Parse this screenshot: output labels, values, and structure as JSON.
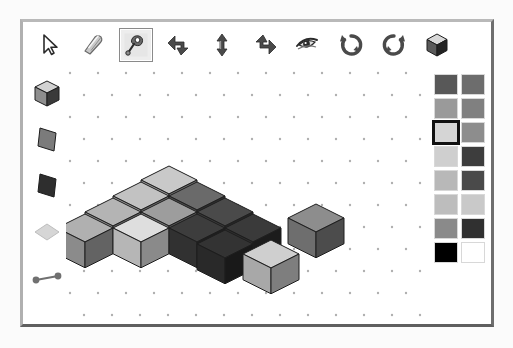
{
  "app": {
    "title": "Isometric Cube Builder",
    "background_color": "#ffffff",
    "frame_color": "#8a8a8a"
  },
  "toolbar": {
    "name": "main-toolbar",
    "selected_index": 2,
    "tools": [
      {
        "id": "select-arrow",
        "label": "Select",
        "icon": "cursor-arrow-icon",
        "selected": false,
        "x": 10
      },
      {
        "id": "eraser",
        "label": "Eraser",
        "icon": "eraser-icon",
        "selected": false,
        "x": 53
      },
      {
        "id": "paint-spray",
        "label": "Paint",
        "icon": "paint-spray-icon",
        "selected": true,
        "x": 96
      },
      {
        "id": "move-down-left",
        "label": "Move Down Left",
        "icon": "arrow-bend-left-icon",
        "selected": false,
        "x": 139
      },
      {
        "id": "move-vertical",
        "label": "Move Vertical",
        "icon": "arrow-up-down-icon",
        "selected": false,
        "x": 182
      },
      {
        "id": "move-down-right",
        "label": "Move Down Right",
        "icon": "arrow-bend-right-icon",
        "selected": false,
        "x": 225
      },
      {
        "id": "view-eye",
        "label": "View",
        "icon": "eye-icon",
        "selected": false,
        "x": 268
      },
      {
        "id": "rotate-horizontal",
        "label": "Rotate Horizontal",
        "icon": "rotate-cw-icon",
        "selected": false,
        "x": 311
      },
      {
        "id": "rotate-vertical",
        "label": "Rotate Vertical",
        "icon": "rotate-ccw-icon",
        "selected": false,
        "x": 354
      },
      {
        "id": "cube-render",
        "label": "Render Cube",
        "icon": "cube-icon",
        "selected": false,
        "x": 397
      }
    ]
  },
  "shape_palette": {
    "name": "shape-palette",
    "shapes": [
      {
        "id": "cube-shape",
        "label": "Cube",
        "icon": "cube-shape-icon",
        "top": "#d2d2d2",
        "left": "#8e8e8e",
        "right": "#3a3a3a"
      },
      {
        "id": "plane-gray",
        "label": "Plane (Gray)",
        "icon": "plane-shape-icon",
        "fill": "#7b7b7b"
      },
      {
        "id": "plane-dark",
        "label": "Plane (Dark)",
        "icon": "plane-shape-icon",
        "fill": "#2e2e2e"
      },
      {
        "id": "diamond-shape",
        "label": "Diamond",
        "icon": "diamond-shape-icon",
        "fill": "#d6d6d6"
      },
      {
        "id": "edge-line",
        "label": "Edge",
        "icon": "line-segment-icon",
        "fill": "#707070"
      }
    ]
  },
  "color_palette": {
    "name": "color-palette",
    "columns": 2,
    "selected_index": 4,
    "swatches": [
      {
        "index": 0,
        "color": "#585858",
        "label": "Dark Gray"
      },
      {
        "index": 1,
        "color": "#6d6d6d",
        "label": "Gray"
      },
      {
        "index": 2,
        "color": "#9a9a9a",
        "label": "Medium Gray"
      },
      {
        "index": 3,
        "color": "#808080",
        "label": "Mid Gray"
      },
      {
        "index": 4,
        "color": "#d5d5d5",
        "label": "Light Gray"
      },
      {
        "index": 5,
        "color": "#8d8d8d",
        "label": "Gray"
      },
      {
        "index": 6,
        "color": "#cfcfcf",
        "label": "Light Gray"
      },
      {
        "index": 7,
        "color": "#3d3d3d",
        "label": "Charcoal"
      },
      {
        "index": 8,
        "color": "#b8b8b8",
        "label": "Silver"
      },
      {
        "index": 9,
        "color": "#4a4a4a",
        "label": "Dark Slate"
      },
      {
        "index": 10,
        "color": "#bdbdbd",
        "label": "Silver"
      },
      {
        "index": 11,
        "color": "#c9c9c9",
        "label": "Pale Gray"
      },
      {
        "index": 12,
        "color": "#8a8a8a",
        "label": "Gray"
      },
      {
        "index": 13,
        "color": "#303030",
        "label": "Near Black"
      },
      {
        "index": 14,
        "color": "#000000",
        "label": "Black"
      },
      {
        "index": 15,
        "color": "#ffffff",
        "label": "White"
      }
    ]
  },
  "canvas": {
    "name": "drawing-canvas",
    "grid": {
      "type": "isometric-dot-grid",
      "dot_color": "#b0b0b0",
      "dot_radius": 1.2,
      "spacing_x": 28,
      "spacing_y": 22,
      "visible": true
    },
    "cube_size": 28,
    "cubes": [
      {
        "id": "c1",
        "x": 103,
        "y": 97,
        "top": "#c9c9c9",
        "left": "#9e9e9e",
        "right": "#6e6e6e"
      },
      {
        "id": "c2",
        "x": 75,
        "y": 113,
        "top": "#c2c2c2",
        "left": "#979797",
        "right": "#6b6b6b"
      },
      {
        "id": "c3",
        "x": 131,
        "y": 113,
        "top": "#6a6a6a",
        "left": "#4f4f4f",
        "right": "#2f2f2f"
      },
      {
        "id": "c4",
        "x": 47,
        "y": 129,
        "top": "#b4b4b4",
        "left": "#8e8e8e",
        "right": "#666666"
      },
      {
        "id": "c5",
        "x": 103,
        "y": 129,
        "top": "#9d9d9d",
        "left": "#7c7c7c",
        "right": "#545454"
      },
      {
        "id": "c6",
        "x": 159,
        "y": 129,
        "top": "#4a4a4a",
        "left": "#3a3a3a",
        "right": "#262626"
      },
      {
        "id": "c7",
        "x": 19,
        "y": 145,
        "top": "#b0b0b0",
        "left": "#8b8b8b",
        "right": "#636363"
      },
      {
        "id": "c8",
        "x": 75,
        "y": 145,
        "top": "#dedede",
        "left": "#b6b6b6",
        "right": "#8a8a8a"
      },
      {
        "id": "c9",
        "x": 131,
        "y": 145,
        "top": "#3d3d3d",
        "left": "#313131",
        "right": "#1f1f1f"
      },
      {
        "id": "c10",
        "x": 187,
        "y": 145,
        "top": "#3a3a3a",
        "left": "#2e2e2e",
        "right": "#1c1c1c"
      },
      {
        "id": "c11",
        "x": 159,
        "y": 161,
        "top": "#333333",
        "left": "#292929",
        "right": "#191919"
      },
      {
        "id": "c12",
        "x": 250,
        "y": 135,
        "top": "#8d8d8d",
        "left": "#6e6e6e",
        "right": "#4c4c4c"
      },
      {
        "id": "c13",
        "x": 205,
        "y": 171,
        "top": "#cfcfcf",
        "left": "#a8a8a8",
        "right": "#7e7e7e"
      }
    ]
  }
}
